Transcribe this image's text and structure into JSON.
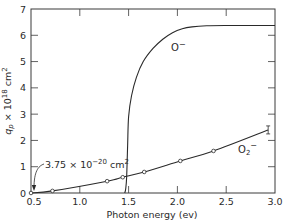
{
  "chart_data": {
    "type": "line",
    "title": "",
    "xlabel": "Photon energy (ev)",
    "ylabel": "q_p × 10^18 cm^2",
    "xlim": [
      0.5,
      3.0
    ],
    "ylim": [
      0,
      7
    ],
    "grid": false,
    "x_ticks": [
      "0.5",
      "1.0",
      "1.5",
      "2.0",
      "2.5",
      "3.0"
    ],
    "y_ticks": [
      "0",
      "1",
      "2",
      "3",
      "4",
      "5",
      "6",
      "7"
    ],
    "series": [
      {
        "name": "O⁻",
        "label": "O",
        "label_sup": "−",
        "markers": false,
        "x": [
          1.46,
          1.47,
          1.48,
          1.49,
          1.5,
          1.53,
          1.58,
          1.65,
          1.75,
          1.85,
          1.95,
          2.05,
          2.15,
          2.3,
          2.5,
          3.0
        ],
        "values": [
          0.0,
          0.15,
          0.6,
          1.8,
          2.9,
          3.7,
          4.4,
          5.0,
          5.5,
          5.85,
          6.1,
          6.25,
          6.32,
          6.36,
          6.37,
          6.37
        ]
      },
      {
        "name": "O₂⁻",
        "label": "O",
        "label_sub": "2",
        "label_sup": "−",
        "markers": true,
        "x": [
          0.5,
          0.72,
          1.28,
          1.44,
          1.66,
          2.03,
          2.37,
          2.93
        ],
        "values": [
          0.0,
          0.08,
          0.45,
          0.6,
          0.8,
          1.22,
          1.6,
          2.4
        ]
      }
    ],
    "annotations": [
      {
        "text": "3.75 × 10",
        "sup": "−20",
        "unit": " cm",
        "unit_sup": "2",
        "points_to_x": 0.5,
        "points_to_y": 0.0
      }
    ]
  },
  "axes": {
    "y_label_parts": {
      "q": "q",
      "sub": "p",
      "mid": " × 10",
      "sup": "18",
      "unit": " cm",
      "unit_sup": "2"
    }
  }
}
